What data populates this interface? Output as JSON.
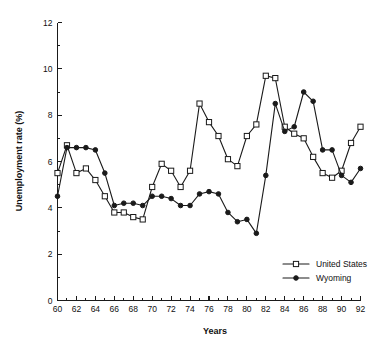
{
  "chart_data": {
    "type": "line",
    "title": "",
    "xlabel": "Years",
    "ylabel": "Unemployment rate (%)",
    "xlim": [
      60,
      92
    ],
    "ylim": [
      0,
      12
    ],
    "x_tick_labels": [
      "60",
      "62",
      "64",
      "66",
      "68",
      "70",
      "72",
      "74",
      "76",
      "78",
      "80",
      "82",
      "84",
      "86",
      "88",
      "90",
      "92"
    ],
    "x_tick_values": [
      60,
      62,
      64,
      66,
      68,
      70,
      72,
      74,
      76,
      78,
      80,
      82,
      84,
      86,
      88,
      90,
      92
    ],
    "x_minor_step": 1,
    "y_tick_labels": [
      "0",
      "2",
      "4",
      "6",
      "8",
      "10",
      "12"
    ],
    "y_tick_values": [
      0,
      2,
      4,
      6,
      8,
      10,
      12
    ],
    "y_minor_step": 1,
    "grid": false,
    "legend_position": "bottom-right",
    "x": [
      60,
      61,
      62,
      63,
      64,
      65,
      66,
      67,
      68,
      69,
      70,
      71,
      72,
      73,
      74,
      75,
      76,
      77,
      78,
      79,
      80,
      81,
      82,
      83,
      84,
      85,
      86,
      87,
      88,
      89,
      90,
      91,
      92
    ],
    "series": [
      {
        "name": "United States",
        "marker": "open-square",
        "values": [
          5.5,
          6.7,
          5.5,
          5.7,
          5.2,
          4.5,
          3.8,
          3.8,
          3.6,
          3.5,
          4.9,
          5.9,
          5.6,
          4.9,
          5.6,
          8.5,
          7.7,
          7.1,
          6.1,
          5.8,
          7.1,
          7.6,
          9.7,
          9.6,
          7.5,
          7.2,
          7.0,
          6.2,
          5.5,
          5.3,
          5.6,
          6.8,
          7.5
        ]
      },
      {
        "name": "Wyoming",
        "marker": "filled-circle",
        "values": [
          4.5,
          6.6,
          6.6,
          6.6,
          6.5,
          5.5,
          4.1,
          4.2,
          4.2,
          4.1,
          4.5,
          4.5,
          4.4,
          4.1,
          4.1,
          4.6,
          4.7,
          4.6,
          3.8,
          3.4,
          3.5,
          2.9,
          5.4,
          8.5,
          7.3,
          7.5,
          9.0,
          8.6,
          6.5,
          6.5,
          5.4,
          5.1,
          5.7
        ]
      }
    ]
  },
  "legend": {
    "entries": [
      {
        "label": "United States"
      },
      {
        "label": "Wyoming"
      }
    ]
  }
}
